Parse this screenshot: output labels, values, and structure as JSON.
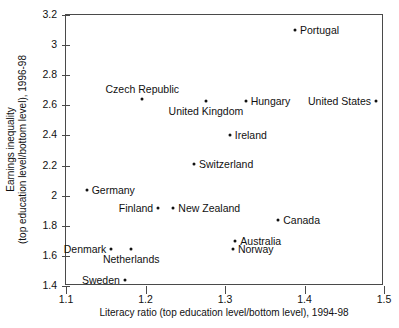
{
  "chart_data": {
    "type": "scatter",
    "title": "",
    "xlabel": "Literacy ratio (top education level/bottom level), 1994-98",
    "ylabel_line1": "Earnings inequality",
    "ylabel_line2": "(top education level/bottom level), 1996-98",
    "xlim": [
      1.1,
      1.5
    ],
    "ylim": [
      1.4,
      3.2
    ],
    "xticks": [
      "1.1",
      "1.2",
      "1.3",
      "1.4",
      "1.5"
    ],
    "xtick_values": [
      1.1,
      1.2,
      1.3,
      1.4,
      1.5
    ],
    "yticks": [
      "1.4",
      "1.6",
      "1.8",
      "2",
      "2.2",
      "2.4",
      "2.6",
      "2.8",
      "3",
      "3.2"
    ],
    "ytick_values": [
      1.4,
      1.6,
      1.8,
      2.0,
      2.2,
      2.4,
      2.6,
      2.8,
      3.0,
      3.2
    ],
    "grid": false,
    "legend": "none",
    "marker_color": "#111111",
    "frame_color": "#4a4a4a",
    "points": [
      {
        "name": "Portugal",
        "x": 1.388,
        "y": 3.1,
        "label_pos": "right"
      },
      {
        "name": "Czech Republic",
        "x": 1.196,
        "y": 2.64,
        "label_pos": "above"
      },
      {
        "name": "United Kingdom",
        "x": 1.276,
        "y": 2.63,
        "label_pos": "below"
      },
      {
        "name": "Hungary",
        "x": 1.326,
        "y": 2.63,
        "label_pos": "right"
      },
      {
        "name": "United States",
        "x": 1.49,
        "y": 2.63,
        "label_pos": "left"
      },
      {
        "name": "Ireland",
        "x": 1.306,
        "y": 2.4,
        "label_pos": "right"
      },
      {
        "name": "Switzerland",
        "x": 1.261,
        "y": 2.21,
        "label_pos": "right"
      },
      {
        "name": "Germany",
        "x": 1.126,
        "y": 2.04,
        "label_pos": "right"
      },
      {
        "name": "Finland",
        "x": 1.216,
        "y": 1.92,
        "label_pos": "left"
      },
      {
        "name": "New Zealand",
        "x": 1.235,
        "y": 1.92,
        "label_pos": "right"
      },
      {
        "name": "Canada",
        "x": 1.367,
        "y": 1.84,
        "label_pos": "right"
      },
      {
        "name": "Australia",
        "x": 1.313,
        "y": 1.7,
        "label_pos": "right"
      },
      {
        "name": "Denmark",
        "x": 1.157,
        "y": 1.645,
        "label_pos": "left"
      },
      {
        "name": "Netherlands",
        "x": 1.182,
        "y": 1.645,
        "label_pos": "below"
      },
      {
        "name": "Norway",
        "x": 1.31,
        "y": 1.645,
        "label_pos": "right"
      },
      {
        "name": "Sweden",
        "x": 1.174,
        "y": 1.44,
        "label_pos": "left"
      }
    ]
  }
}
